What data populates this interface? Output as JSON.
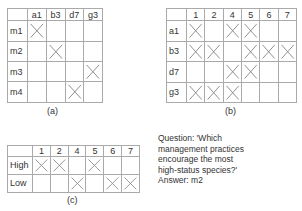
{
  "colors": {
    "border": "#777777",
    "inner_line": "#aaaaaa",
    "mark": "#888888",
    "text": "#333333"
  },
  "table_a": {
    "caption": "(a)",
    "columns": [
      "a1",
      "b3",
      "d7",
      "g3"
    ],
    "rows": [
      {
        "label": "m1",
        "marks": [
          true,
          false,
          false,
          false
        ]
      },
      {
        "label": "m2",
        "marks": [
          false,
          true,
          false,
          false
        ]
      },
      {
        "label": "m3",
        "marks": [
          false,
          false,
          false,
          true
        ]
      },
      {
        "label": "m4",
        "marks": [
          false,
          false,
          true,
          false
        ]
      }
    ]
  },
  "table_b": {
    "caption": "(b)",
    "columns": [
      "1",
      "2",
      "4",
      "5",
      "6",
      "7"
    ],
    "rows": [
      {
        "label": "a1",
        "marks": [
          true,
          false,
          true,
          true,
          false,
          false
        ]
      },
      {
        "label": "b3",
        "marks": [
          true,
          true,
          false,
          true,
          true,
          true
        ]
      },
      {
        "label": "d7",
        "marks": [
          false,
          false,
          true,
          true,
          false,
          false
        ]
      },
      {
        "label": "g3",
        "marks": [
          true,
          true,
          true,
          false,
          false,
          false
        ]
      }
    ]
  },
  "table_c": {
    "caption": "(c)",
    "columns": [
      "1",
      "2",
      "4",
      "5",
      "6",
      "7"
    ],
    "rows": [
      {
        "label": "High",
        "marks": [
          true,
          true,
          false,
          true,
          false,
          false
        ]
      },
      {
        "label": "Low",
        "marks": [
          false,
          false,
          true,
          false,
          true,
          true
        ]
      }
    ]
  },
  "question": {
    "lines": [
      "Question: 'Which",
      "management practices",
      "encourage the most",
      "high-status species?'"
    ],
    "answer": "Answer: m2"
  }
}
